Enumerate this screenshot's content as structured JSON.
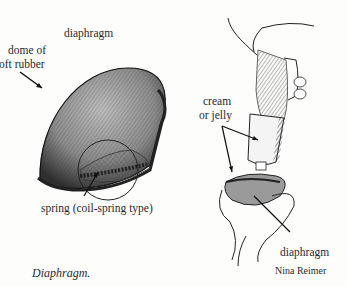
{
  "figure": {
    "caption": "Diaphragm.",
    "credit": "Nina Reimer",
    "left_panel": {
      "labels": {
        "title": "diaphragm",
        "dome_line1": "dome of",
        "dome_line2": "oft rubber",
        "spring": "spring (coil-spring type)"
      }
    },
    "right_panel": {
      "labels": {
        "cream_line1": "cream",
        "cream_line2": "or jelly",
        "diaphragm": "diaphragm"
      }
    }
  }
}
